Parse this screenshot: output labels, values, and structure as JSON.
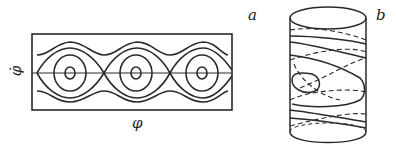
{
  "figure": {
    "panel_a": {
      "label": "a",
      "x_axis_label": "φ",
      "y_axis_label": "φ̇",
      "description": "Phase portrait of pendulum on plane: three centers with closed orbits, separatrix, and rotational trajectories"
    },
    "panel_b": {
      "label": "b",
      "description": "Phase portrait on cylinder surface with solid and dashed trajectories"
    },
    "colors": {
      "stroke": "#2a2a2a",
      "background": "#ffffff"
    }
  }
}
